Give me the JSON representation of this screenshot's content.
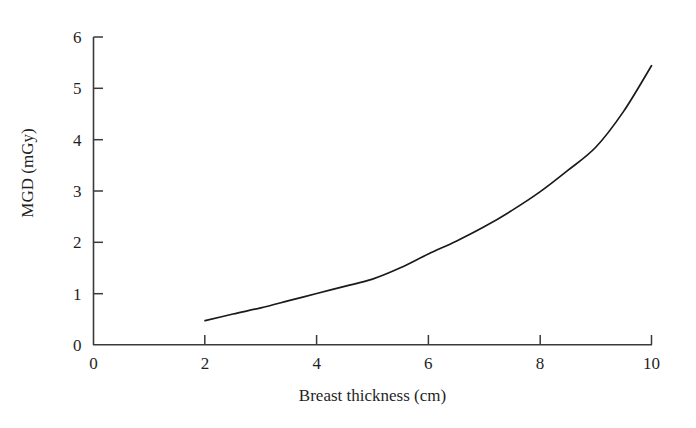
{
  "figure": {
    "background_color": "#ffffff",
    "line_color": "#1a1a1a",
    "axis_color": "#3a3a3a"
  },
  "chart_data": {
    "type": "line",
    "title": "",
    "subtitle": "",
    "xlabel": "Breast thickness (cm)",
    "ylabel": "MGD (mGy)",
    "xlim": [
      0,
      10
    ],
    "ylim": [
      0,
      6
    ],
    "xticks": [
      0,
      2,
      4,
      6,
      8,
      10
    ],
    "xtick_labels": [
      "0",
      "2",
      "4",
      "6",
      "8",
      "10"
    ],
    "yticks": [
      0,
      1,
      2,
      3,
      4,
      5,
      6
    ],
    "ytick_labels": [
      "0",
      "1",
      "2",
      "3",
      "4",
      "5",
      "6"
    ],
    "grid": false,
    "legend": null,
    "legend_position": "none",
    "annotations": [],
    "series": [
      {
        "name": "MGD",
        "color": "#1a1a1a",
        "x": [
          2.0,
          2.5,
          3.0,
          3.5,
          4.0,
          4.5,
          5.0,
          5.5,
          6.0,
          6.5,
          7.0,
          7.5,
          8.0,
          8.5,
          9.0,
          9.5,
          10.0
        ],
        "y": [
          0.47,
          0.6,
          0.72,
          0.86,
          1.0,
          1.14,
          1.28,
          1.5,
          1.77,
          2.02,
          2.3,
          2.62,
          2.98,
          3.4,
          3.85,
          4.55,
          5.44
        ]
      }
    ]
  }
}
